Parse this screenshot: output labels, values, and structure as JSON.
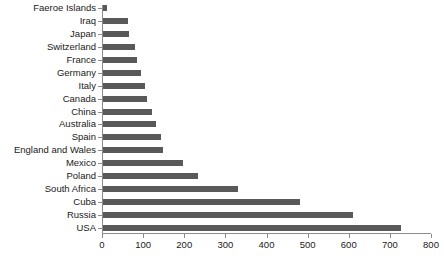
{
  "chart_data": {
    "type": "bar",
    "orientation": "horizontal",
    "title": "",
    "subtitle": "",
    "xlabel": "",
    "ylabel": "",
    "xlim": [
      0,
      800
    ],
    "ylim": null,
    "grid": false,
    "legend": null,
    "bar_color": "#595959",
    "axis_color": "#8c8c8c",
    "text_color": "#1a1a1a",
    "background_color": "#ffffff",
    "xticks": [
      0,
      100,
      200,
      300,
      400,
      500,
      600,
      700,
      800
    ],
    "xtick_labels": [
      "0",
      "100",
      "200",
      "300",
      "400",
      "500",
      "600",
      "700",
      "800"
    ],
    "categories": [
      "Faeroe Islands",
      "Iraq",
      "Japan",
      "Switzerland",
      "France",
      "Germany",
      "Italy",
      "Canada",
      "China",
      "Australia",
      "Spain",
      "England and Wales",
      "Mexico",
      "Poland",
      "South Africa",
      "Cuba",
      "Russia",
      "USA"
    ],
    "values": [
      10,
      61,
      63,
      78,
      83,
      93,
      102,
      107,
      119,
      129,
      141,
      146,
      195,
      232,
      329,
      478,
      608,
      725
    ]
  }
}
